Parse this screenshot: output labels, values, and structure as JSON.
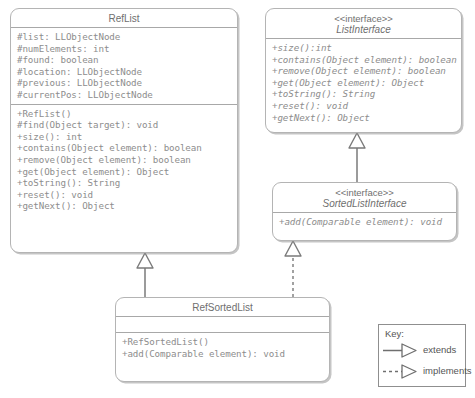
{
  "diagram": {
    "line_color": "#a8a8a8",
    "text_color": "#8d8d8d",
    "title_color": "#6f6f6f"
  },
  "classes": {
    "ref_list": {
      "name": "RefList",
      "attributes": [
        "#list: LLObjectNode",
        "#numElements: int",
        "#found: boolean",
        "#location: LLObjectNode",
        "#previous: LLObjectNode",
        "#currentPos: LLObjectNode"
      ],
      "methods": [
        "+RefList()",
        "#find(Object target): void",
        "+size(): int",
        "+contains(Object element): boolean",
        "+remove(Object element): boolean",
        "+get(Object element): Object",
        "+toString(): String",
        "+reset(): void",
        "+getNext(): Object"
      ]
    },
    "list_interface": {
      "stereotype": "<<interface>>",
      "name": "ListInterface",
      "methods": [
        "+size():int",
        "+contains(Object element): boolean",
        "+remove(Object element): boolean",
        "+get(Object element): Object",
        "+toString(): String",
        "+reset(): void",
        "+getNext(): Object"
      ]
    },
    "sorted_list_interface": {
      "stereotype": "<<interface>>",
      "name": "SortedListInterface",
      "methods": [
        "+add(Comparable element): void"
      ]
    },
    "ref_sorted_list": {
      "name": "RefSortedList",
      "attributes": [],
      "methods": [
        "+RefSortedList()",
        "+add(Comparable element): void"
      ]
    }
  },
  "legend": {
    "title": "Key:",
    "items": [
      {
        "label": "extends",
        "style": "solid"
      },
      {
        "label": "implements",
        "style": "dashed"
      }
    ]
  },
  "relationships": [
    {
      "from": "RefSortedList",
      "to": "RefList",
      "type": "extends"
    },
    {
      "from": "RefSortedList",
      "to": "SortedListInterface",
      "type": "implements"
    },
    {
      "from": "SortedListInterface",
      "to": "ListInterface",
      "type": "extends"
    }
  ]
}
